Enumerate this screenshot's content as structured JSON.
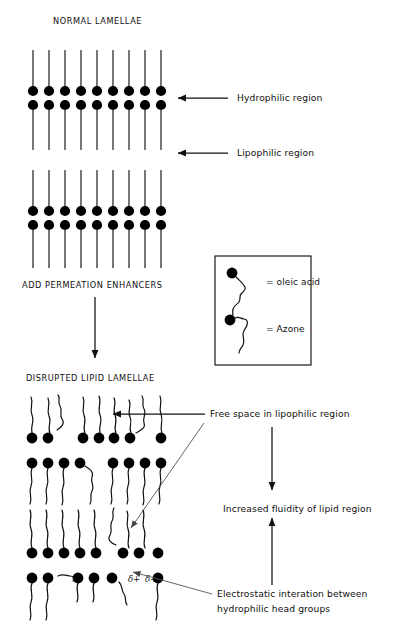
{
  "figure": {
    "title_top": "NORMAL LAMELLAE",
    "title_mid": "ADD PERMEATION ENHANCERS",
    "title_bottom": "DISRUPTED LIPID LAMELLAE",
    "background": "#ffffff",
    "ink": "#111111"
  },
  "labels": {
    "hydrophilic": "Hydrophilic region",
    "lipophilic": "Lipophilic region",
    "free_space": "Free space in lipophilic region",
    "fluidity": "Increased fluidity of lipid region",
    "electrostatic_line1": "Electrostatic interation between",
    "electrostatic_line2": "hydrophilic head groups",
    "delta_left": "δ+",
    "delta_right": "δ+"
  },
  "legend": {
    "items": [
      {
        "symbol": "oleic-acid-molecule",
        "text": "= oleic acid"
      },
      {
        "symbol": "azone-molecule",
        "text": "= Azone"
      }
    ]
  },
  "diagram_data": {
    "type": "schematic",
    "normal_lamellae": {
      "lipid_columns": 9,
      "column_x": [
        33,
        49,
        65,
        81,
        97,
        113,
        129,
        145,
        161
      ],
      "bilayers": [
        {
          "head_row_upper_y": 91,
          "head_row_lower_y": 105,
          "tail_top_y": 50,
          "tail_bottom_y": 150
        },
        {
          "head_row_upper_y": 211,
          "head_row_lower_y": 225,
          "tail_top_y": 170,
          "tail_bottom_y": 268
        }
      ],
      "head_radius": 5.1,
      "tails": "straight"
    },
    "disrupted_lamellae": {
      "tails": "wavy",
      "bilayers": [
        {
          "head_row_upper_y": 438,
          "head_row_lower_y": 463
        },
        {
          "head_row_upper_y": 553,
          "head_row_lower_y": 578
        }
      ]
    }
  }
}
